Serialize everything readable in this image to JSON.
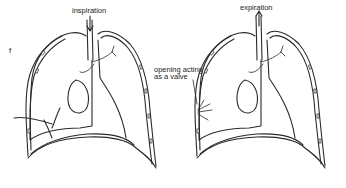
{
  "diagram": {
    "fragment_label": "f",
    "panels": [
      {
        "id": "left",
        "label": "inspiration",
        "arrow_direction": "down"
      },
      {
        "id": "right",
        "label": "expiration",
        "arrow_direction": "up",
        "annotation": "opening acting\nas a valve"
      }
    ],
    "annotation_line1": "opening acting",
    "annotation_line2": "as a valve"
  }
}
